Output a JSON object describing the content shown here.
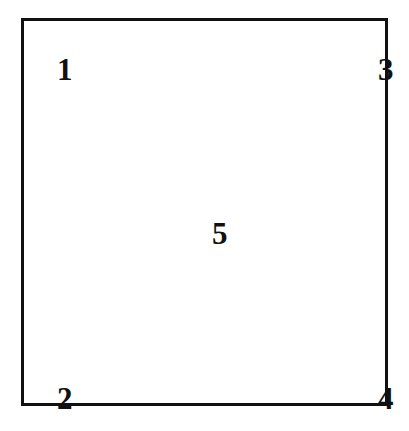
{
  "figure": {
    "background_color": "#ffffff",
    "border_color": "#111111",
    "text_color": "#111111"
  },
  "region_box": {
    "name": "outer rectangle",
    "border_width_px": 3,
    "fill": "#ffffff"
  },
  "labels": {
    "top_left": "1",
    "bottom_left": "2",
    "top_right": "3",
    "bottom_right": "4",
    "center": "5"
  }
}
